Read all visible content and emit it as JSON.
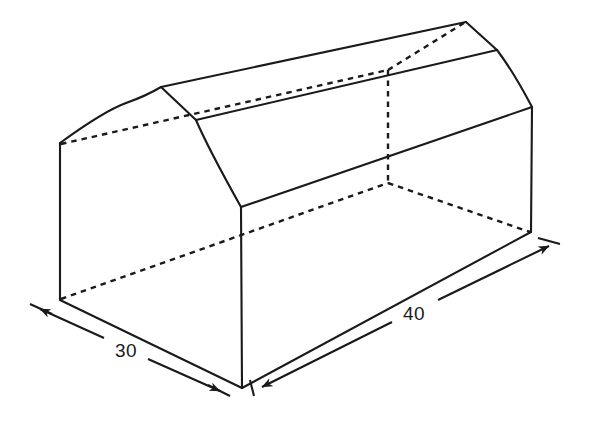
{
  "figure": {
    "stroke_color": "#1a1a1a",
    "background_color": "#ffffff",
    "dimensions": [
      {
        "id": "depth",
        "label": "30",
        "label_x": 126,
        "label_y": 351,
        "arrow_from_x": 42,
        "arrow_from_y": 310,
        "arrow_to_x": 219,
        "arrow_to_y": 390
      },
      {
        "id": "length",
        "label": "40",
        "label_x": 414,
        "label_y": 314,
        "arrow_from_x": 262,
        "arrow_from_y": 387,
        "arrow_to_x": 549,
        "arrow_to_y": 246
      }
    ],
    "vertices": {
      "back_bottom_left": [
        60,
        300
      ],
      "back_eave_left": [
        60,
        143
      ],
      "back_ridge": [
        161,
        87
      ],
      "front_bottom_left": [
        242,
        388
      ],
      "front_eave": [
        241,
        207
      ],
      "front_break": [
        196,
        120
      ],
      "front_ridge": [
        161,
        87
      ],
      "right_ridge": [
        466,
        22
      ],
      "right_break": [
        497,
        50
      ],
      "right_eave": [
        532,
        107
      ],
      "right_bottom": [
        531,
        232
      ],
      "hidden_back_right_top": [
        388,
        70
      ],
      "hidden_back_right_eave": [
        388,
        183
      ]
    }
  }
}
